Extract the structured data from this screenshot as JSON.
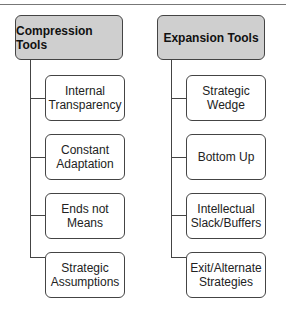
{
  "columns": [
    {
      "title": "Compression Tools",
      "items": [
        "Internal\nTransparency",
        "Constant\nAdaptation",
        "Ends not\nMeans",
        "Strategic\nAssumptions"
      ]
    },
    {
      "title": "Expansion Tools",
      "items": [
        "Strategic\nWedge",
        "Bottom Up",
        "Intellectual\nSlack/Buffers",
        "Exit/Alternate\nStrategies"
      ]
    }
  ]
}
